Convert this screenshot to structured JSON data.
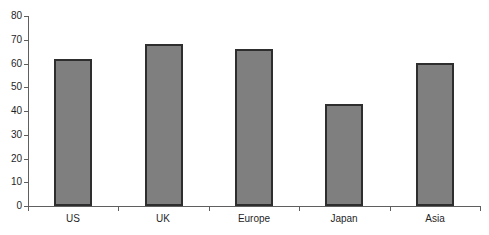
{
  "chart_data": {
    "type": "bar",
    "categories": [
      "US",
      "UK",
      "Europe",
      "Japan",
      "Asia"
    ],
    "values": [
      62,
      68,
      66,
      43,
      60
    ],
    "title": "",
    "xlabel": "",
    "ylabel": "",
    "ylim": [
      0,
      80
    ],
    "ytick_step": 10,
    "ytick_labels": [
      "0",
      "10",
      "20",
      "30",
      "40",
      "50",
      "60",
      "70",
      "80"
    ],
    "grid": false,
    "legend": "none",
    "colors": {
      "bar_fill": "#7f7f7f",
      "bar_border": "#2e2e2e",
      "axis": "#5f5f5f",
      "label_text": "#1f1f1f",
      "background": "#ffffff"
    }
  }
}
